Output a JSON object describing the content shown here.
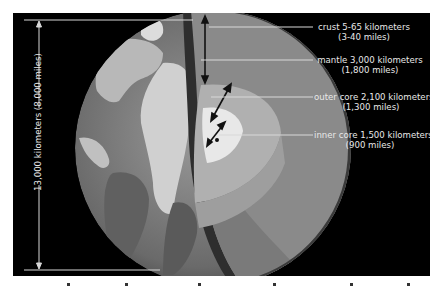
{
  "diagram": {
    "diameter": {
      "line1": "13,000 kilometers",
      "line2": "(8,000 miles)"
    },
    "layers": [
      {
        "name": "crust",
        "line1": "crust 5-65 kilometers",
        "line2": "(3-40 miles)"
      },
      {
        "name": "mantle",
        "line1": "mantle 3,000 kilometers",
        "line2": "(1,800 miles)"
      },
      {
        "name": "outer-core",
        "line1": "outer core 2,100 kilometers",
        "line2": "(1,300 miles)"
      },
      {
        "name": "inner-core",
        "line1": "inner core 1,500 kilometers",
        "line2": "(900 miles)"
      }
    ],
    "colors": {
      "background": "#000000",
      "page": "#ffffff",
      "crust": "#3a3a3a",
      "mantle": "#8a8a8a",
      "outer_core": "#b4b4b4",
      "inner_core": "#e6e6e6",
      "ocean": "#6e6e6e",
      "land": "#c8c8c8",
      "leader_line": "#d8d8d8"
    }
  }
}
